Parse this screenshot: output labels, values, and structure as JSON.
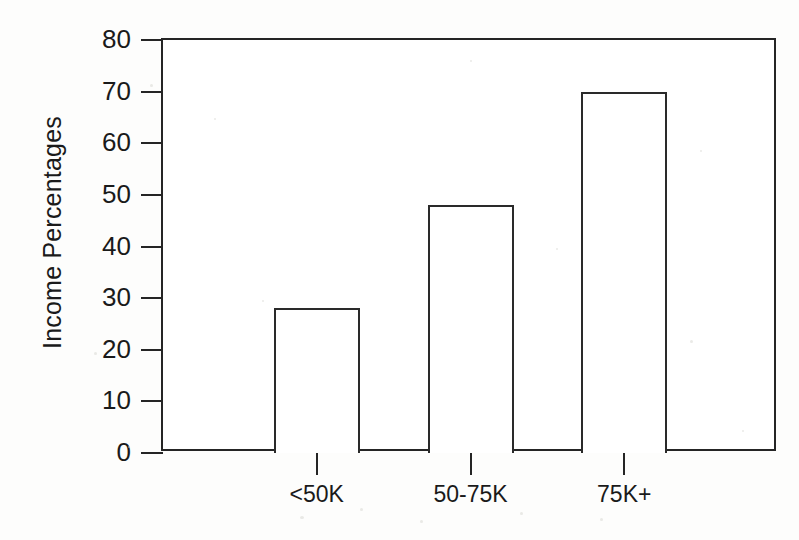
{
  "chart_data": {
    "type": "bar",
    "title": "",
    "subtitle": "",
    "xlabel": "",
    "ylabel": "Income Percentages",
    "categories": [
      "<50K",
      "50-75K",
      "75K+"
    ],
    "values": [
      28,
      48,
      70
    ],
    "series": [
      {
        "name": "Income Percentages",
        "values": [
          28,
          48,
          70
        ]
      }
    ],
    "ylim": [
      0,
      80
    ],
    "yticks": [
      0,
      10,
      20,
      30,
      40,
      50,
      60,
      70,
      80
    ],
    "ytick_labels": [
      "0",
      "10",
      "20",
      "30",
      "40",
      "50",
      "60",
      "70",
      "80"
    ],
    "grid": false,
    "legend": false,
    "legend_position": "none",
    "bar_fill_color": "#ffffff",
    "bar_edge_color": "#2a2a2a",
    "axis_color": "#252525",
    "background_color": "#fdfdfc",
    "annotations": []
  }
}
